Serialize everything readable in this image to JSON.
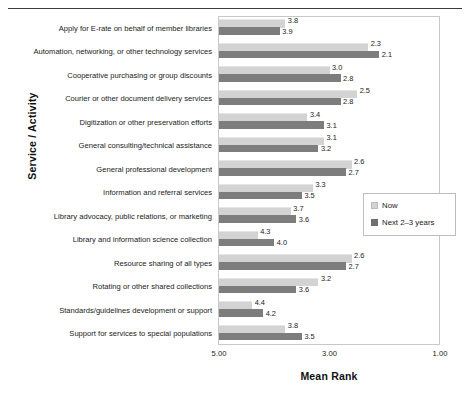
{
  "chart_data": {
    "type": "bar",
    "orientation": "horizontal",
    "title": "",
    "xlabel": "Mean Rank",
    "ylabel": "Service / Activity",
    "xlim": [
      5.0,
      1.0
    ],
    "x_reversed": true,
    "xticks": [
      "5.00",
      "3.00",
      "1.00"
    ],
    "xtick_values": [
      5.0,
      3.0,
      1.0
    ],
    "grid": false,
    "legend_position": "right-middle",
    "categories": [
      "Apply for E-rate on behalf of member libraries",
      "Automation, networking, or other technology services",
      "Cooperative purchasing or group discounts",
      "Courier or other document delivery services",
      "Digitization or other preservation efforts",
      "General consulting/technical assistance",
      "General professional development",
      "Information and referral services",
      "Library advocacy, public relations, or marketing",
      "Library and information science collection",
      "Resource sharing of all types",
      "Rotating or other shared collections",
      "Standards/guidelines development or support",
      "Support for services to special populations"
    ],
    "series": [
      {
        "name": "Now",
        "color": "#d3d3d3",
        "values": [
          3.8,
          2.3,
          3.0,
          2.5,
          3.4,
          3.1,
          2.6,
          3.3,
          3.7,
          4.3,
          2.6,
          3.2,
          4.4,
          3.8
        ],
        "labels": [
          "3.8",
          "2.3",
          "3.0",
          "2.5",
          "3.4",
          "3.1",
          "2.6",
          "3.3",
          "3.7",
          "4.3",
          "2.6",
          "3.2",
          "4.4",
          "3.8"
        ]
      },
      {
        "name": "Next 2–3 years",
        "color": "#7d7d7d",
        "values": [
          3.9,
          2.1,
          2.8,
          2.8,
          3.1,
          3.2,
          2.7,
          3.5,
          3.6,
          4.0,
          2.7,
          3.6,
          4.2,
          3.5
        ],
        "labels": [
          "3.9",
          "2.1",
          "2.8",
          "2.8",
          "3.1",
          "3.2",
          "2.7",
          "3.5",
          "3.6",
          "4.0",
          "2.7",
          "3.6",
          "4.2",
          "3.5"
        ]
      }
    ]
  },
  "legend": {
    "items": [
      {
        "label": "Now",
        "color": "#d3d3d3"
      },
      {
        "label": "Next 2–3 years",
        "color": "#7d7d7d"
      }
    ]
  }
}
